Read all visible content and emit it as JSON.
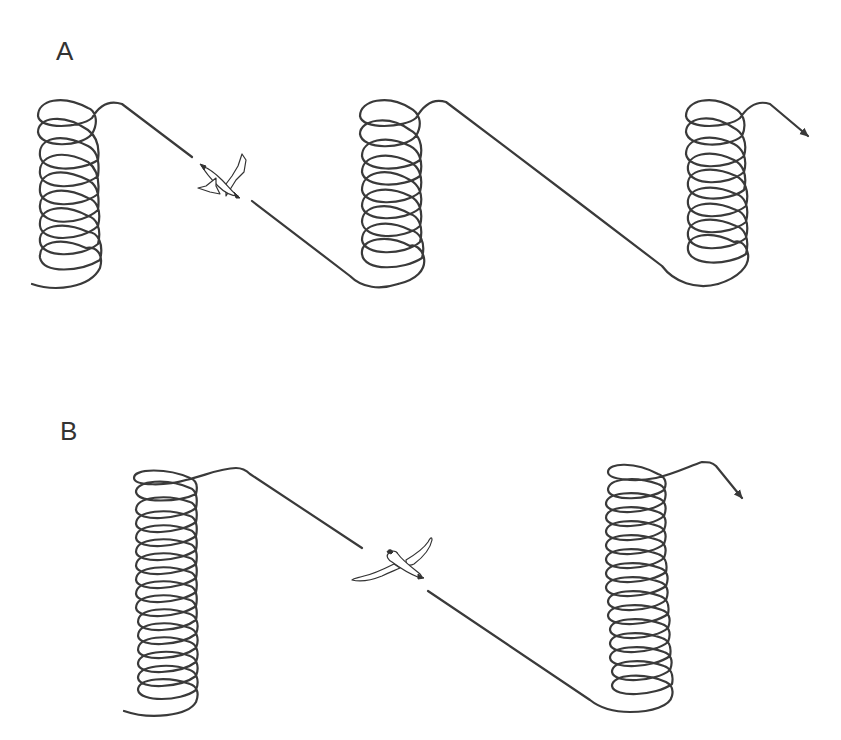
{
  "figure": {
    "panels": [
      {
        "id": "A",
        "label": "A",
        "description": "Three thermal spirals of ~5 loops each connected by straight glides; small bird mid-glide; arrow exits right",
        "spirals": [
          {
            "cx": 60,
            "top": 105,
            "bottom": 285,
            "loops": 5
          },
          {
            "cx": 385,
            "top": 105,
            "bottom": 285,
            "loops": 5
          },
          {
            "cx": 710,
            "top": 100,
            "bottom": 285,
            "loops": 5
          }
        ],
        "bird": {
          "x": 220,
          "y": 178,
          "type": "flapping-small"
        },
        "exit_arrow": {
          "x": 810,
          "y": 137
        }
      },
      {
        "id": "B",
        "label": "B",
        "description": "Two tall thermal spirals of ~10 loops each connected by a long straight glide; soaring bird mid-glide; arrow exits right",
        "spirals": [
          {
            "cx": 165,
            "top": 468,
            "bottom": 715,
            "loops": 10
          },
          {
            "cx": 640,
            "top": 462,
            "bottom": 712,
            "loops": 10
          }
        ],
        "bird": {
          "x": 392,
          "y": 568,
          "type": "soaring-albatross"
        },
        "exit_arrow": {
          "x": 742,
          "y": 500
        }
      }
    ],
    "colors": {
      "stroke": "#3a3a3a",
      "background": "#ffffff",
      "label": "#333333"
    }
  }
}
